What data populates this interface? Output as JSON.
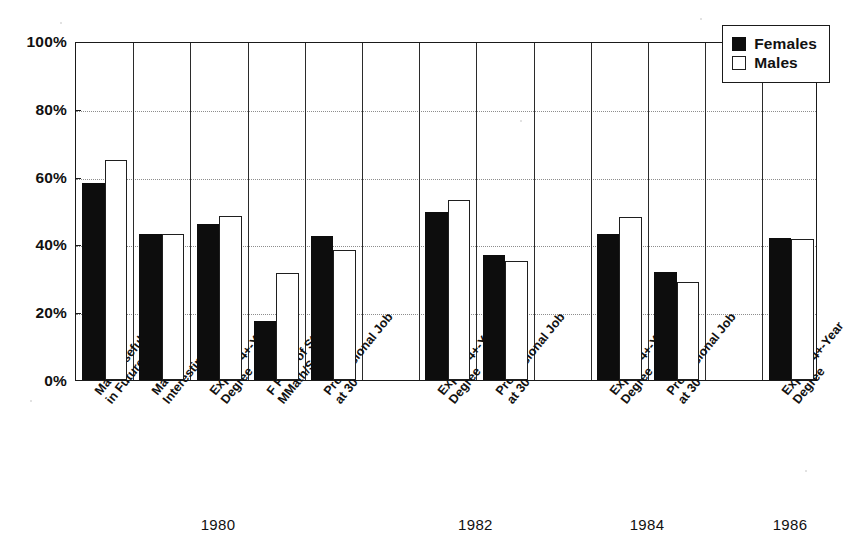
{
  "chart_data": {
    "type": "bar",
    "title": "",
    "xlabel": "",
    "ylabel": "",
    "ylim": [
      0,
      100
    ],
    "ytick_labels": [
      "0%",
      "20%",
      "40%",
      "60%",
      "80%",
      "100%"
    ],
    "ytick_values": [
      0,
      20,
      40,
      60,
      80,
      100
    ],
    "gridlines": [
      20,
      40,
      60,
      80
    ],
    "grid": true,
    "legend_position": "top-right",
    "legend": [
      {
        "name": "Females",
        "fill": "#0d0d0d"
      },
      {
        "name": "Males",
        "fill": "#ffffff"
      }
    ],
    "series": [
      {
        "name": "Females",
        "values": [
          58,
          43,
          46,
          17.5,
          42.5,
          49.5,
          37,
          43,
          32,
          42
        ]
      },
      {
        "name": "Males",
        "values": [
          65,
          43,
          48.5,
          31.5,
          38.5,
          53,
          35,
          48,
          29,
          41.5
        ]
      }
    ],
    "categories": [
      "Math Useful in Future",
      "Math Interesting",
      "Expect 4+-Year Degree",
      "F Field of Study, MMath/Science",
      "Professional Job at 30",
      "Expect 4+-Year Degree",
      "Professional Job at 30",
      "Expect 4+-Year Degree",
      "Professional Job at 30",
      "Expect 4+-Year Degree"
    ],
    "category_lines": [
      [
        "Math Useful",
        "in Future"
      ],
      [
        "Math",
        "Interesting"
      ],
      [
        "Expect 4+-Year",
        "Degree"
      ],
      [
        "F Field of Study,",
        "MMath/Science"
      ],
      [
        "Professional Job",
        "at 30"
      ],
      [
        "Expect 4+-Year",
        "Degree"
      ],
      [
        "Professional Job",
        "at 30"
      ],
      [
        "Expect 4+-Year",
        "Degree"
      ],
      [
        "Professional Job",
        "at 30"
      ],
      [
        "Expect 4+-Year",
        "Degree"
      ]
    ],
    "group_labels": [
      "1980",
      "1982",
      "1984",
      "1986"
    ],
    "group_membership": [
      0,
      0,
      0,
      0,
      0,
      1,
      1,
      2,
      2,
      3
    ],
    "colors": {
      "female": "#0d0d0d",
      "male": "#ffffff",
      "axis": "#1a1a1a",
      "grid": "#8d8d8d"
    }
  }
}
